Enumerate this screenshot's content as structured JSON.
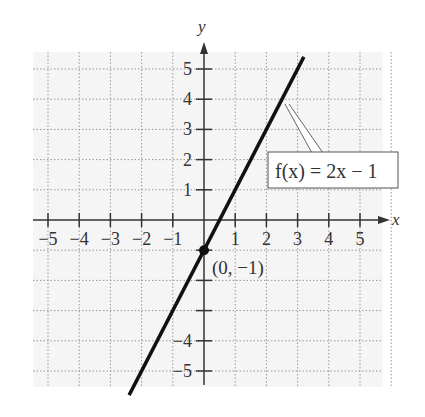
{
  "chart_data": {
    "type": "line",
    "title": "",
    "xlabel": "x",
    "ylabel": "y",
    "xlim": [
      -5,
      5
    ],
    "ylim": [
      -5,
      5
    ],
    "grid": true,
    "x_ticks": [
      "−5",
      "−4",
      "−3",
      "−2",
      "−1",
      "1",
      "2",
      "3",
      "4",
      "5"
    ],
    "y_ticks": [
      "5",
      "4",
      "3",
      "2",
      "1",
      "−4",
      "−5"
    ],
    "series": [
      {
        "name": "f(x) = 2x − 1",
        "equation": "f(x) = 2x - 1",
        "slope": 2,
        "intercept": -1,
        "x": [
          -2.4,
          3.2
        ],
        "y": [
          -5.8,
          5.4
        ]
      }
    ],
    "points": [
      {
        "label": "(0, −1)",
        "x": 0,
        "y": -1
      }
    ],
    "annotations": [
      {
        "text": "f(x) = 2x − 1",
        "target_x": 2.5,
        "target_y": 4
      }
    ]
  },
  "labels": {
    "x_axis": "x",
    "y_axis": "y",
    "function": "f(x) = 2x − 1",
    "point": "(0, −1)"
  }
}
